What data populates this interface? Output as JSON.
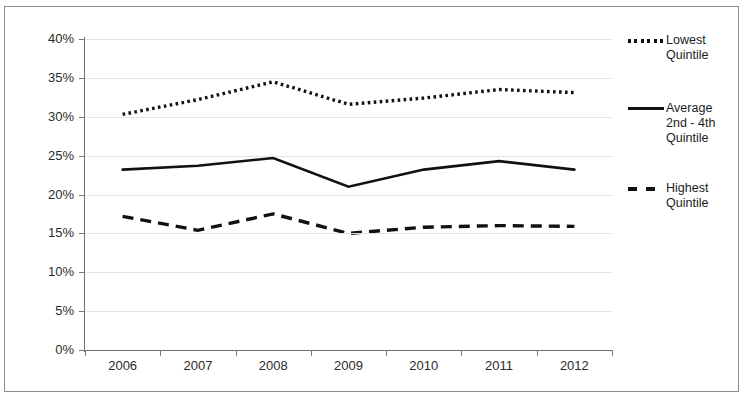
{
  "chart_data": {
    "type": "line",
    "title": "",
    "subtitle": "",
    "xlabel": "",
    "ylabel": "",
    "categories": [
      "2006",
      "2007",
      "2008",
      "2009",
      "2010",
      "2011",
      "2012"
    ],
    "x_tick_labels": [
      "2006",
      "2007",
      "2008",
      "2009",
      "2010",
      "2011",
      "2012"
    ],
    "y_tick_labels": [
      "40%",
      "35%",
      "30%",
      "25%",
      "20%",
      "15%",
      "10%",
      "5%",
      "0%"
    ],
    "y_tick_values": [
      40,
      35,
      30,
      25,
      20,
      15,
      10,
      5,
      0
    ],
    "ylim": [
      0,
      40
    ],
    "y_unit": "%",
    "grid": true,
    "grid_axis": "y",
    "legend_position": "right",
    "series": [
      {
        "name": "Lowest Quintile",
        "legend_label": "Lowest\nQuintile",
        "style": "dotted",
        "color": "#111111",
        "values": [
          30.3,
          32.2,
          34.5,
          31.6,
          32.4,
          33.5,
          33.1
        ]
      },
      {
        "name": "Average 2nd - 4th Quintile",
        "legend_label": "Average\n2nd - 4th\nQuintile",
        "style": "solid",
        "color": "#111111",
        "values": [
          23.2,
          23.7,
          24.7,
          21.0,
          23.2,
          24.3,
          23.2
        ]
      },
      {
        "name": "Highest Quintile",
        "legend_label": "Highest\nQuintile",
        "style": "dashed",
        "color": "#111111",
        "values": [
          17.2,
          15.4,
          17.5,
          15.0,
          15.8,
          16.0,
          15.9
        ]
      }
    ]
  },
  "legend": {
    "entries": [
      {
        "label": "Lowest\nQuintile"
      },
      {
        "label": "Average\n2nd - 4th\nQuintile"
      },
      {
        "label": "Highest\nQuintile"
      }
    ]
  }
}
